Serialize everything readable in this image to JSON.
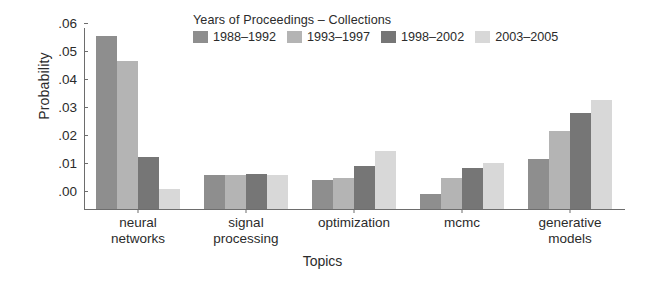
{
  "chart_data": {
    "type": "bar",
    "title": "",
    "xlabel": "Topics",
    "ylabel": "Probability",
    "categories": [
      "neural networks",
      "signal processing",
      "optimization",
      "mcmc",
      "generative models"
    ],
    "category_lines": [
      [
        "neural",
        "networks"
      ],
      [
        "signal",
        "processing"
      ],
      [
        "optimization"
      ],
      [
        "mcmc"
      ],
      [
        "generative",
        "models"
      ]
    ],
    "series": [
      {
        "name": "1988-1992",
        "color": "#8e8e8e",
        "values": [
          0.0615,
          0.0122,
          0.0103,
          0.0055,
          0.0178
        ]
      },
      {
        "name": "1993-1997",
        "color": "#b4b4b4",
        "values": [
          0.0527,
          0.012,
          0.011,
          0.0112,
          0.0277
        ]
      },
      {
        "name": "1998-2002",
        "color": "#767676",
        "values": [
          0.0185,
          0.0124,
          0.0152,
          0.0145,
          0.0343
        ]
      },
      {
        "name": "2003-2005",
        "color": "#d8d8d8",
        "values": [
          0.0072,
          0.012,
          0.0205,
          0.0165,
          0.039
        ]
      }
    ],
    "ylim": [
      0.0,
      0.0645
    ],
    "yticks": [
      0.0,
      0.01,
      0.02,
      0.03,
      0.04,
      0.05,
      0.06
    ],
    "ytick_labels": [
      ".00",
      ".01",
      ".02",
      ".03",
      ".04",
      ".05",
      ".06"
    ],
    "grid": false,
    "legend_position": "top-center",
    "axis_color": "#6d6d6d",
    "text_color": "#2b2b2b",
    "background": "#ffffff"
  },
  "legend": {
    "title": "Years of Proceedings – Collections",
    "entries": [
      {
        "label": "1988–1992",
        "color": "#8e8e8e"
      },
      {
        "label": "1993–1997",
        "color": "#b4b4b4"
      },
      {
        "label": "1998–2002",
        "color": "#767676"
      },
      {
        "label": "2003–2005",
        "color": "#d8d8d8"
      }
    ]
  },
  "axes": {
    "ylabel": "Probability",
    "xlabel": "Topics"
  }
}
